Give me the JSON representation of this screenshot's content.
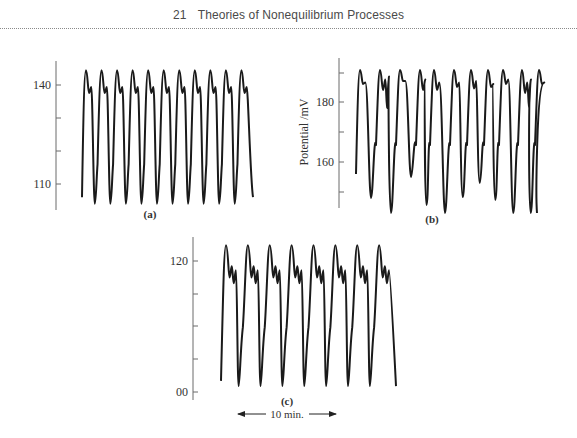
{
  "page": {
    "running_head_number": "21",
    "running_head_title": "Theories of Nonequilibrium Processes"
  },
  "colors": {
    "trace": "#1a1a1a",
    "axis": "#6a6a6a",
    "text": "#333333",
    "rule": "#8a8a8a"
  },
  "chart_data": [
    {
      "type": "line",
      "panel_label": "(a)",
      "title": "",
      "xlabel": "",
      "ylabel": "",
      "y_tick_labels": [
        "140",
        "110"
      ],
      "y_ticks": [
        140,
        130,
        120,
        110
      ],
      "ylim": [
        102,
        148
      ],
      "grid": false,
      "legend": null,
      "description": "Regular periodic oscillations, 11 cycles, each with a peak followed by a small shoulder",
      "cycles": 11,
      "series": [
        {
          "name": "potential",
          "cycle_shape": {
            "peak": 144.5,
            "shoulder_dip": 137.6,
            "shoulder_peak": 139.4,
            "trough": 104
          },
          "troughs": [
            104,
            104,
            104,
            104,
            104,
            104,
            104,
            104,
            104,
            104
          ],
          "start_value": 106,
          "end_value": 106
        }
      ]
    },
    {
      "type": "line",
      "panel_label": "(b)",
      "title": "",
      "xlabel": "",
      "ylabel": "Potential /mV",
      "y_tick_labels": [
        "180",
        "160"
      ],
      "y_ticks": [
        190,
        180,
        170,
        160,
        150
      ],
      "ylim": [
        140,
        195
      ],
      "grid": false,
      "legend": null,
      "description": "Irregular (chaotic-like) oscillations with varying trough depths and multi-peaked shoulders",
      "cycles": 11,
      "series": [
        {
          "name": "potential",
          "peaks": [
            190.7,
            190.7,
            190.7,
            190.7,
            190.7,
            190.7,
            190.7,
            190.7,
            190.7,
            190.7,
            190.7
          ],
          "troughs": [
            148,
            143,
            155,
            145.7,
            143,
            148.3,
            153,
            147.3,
            143,
            143
          ],
          "start_value": 156,
          "end_value": 143
        }
      ]
    },
    {
      "type": "line",
      "panel_label": "(c)",
      "title": "",
      "xlabel": "",
      "ylabel": "",
      "y_tick_labels": [
        "120",
        "00"
      ],
      "y_ticks": [
        120,
        115,
        110,
        105,
        100
      ],
      "ylim": [
        98,
        124
      ],
      "grid": false,
      "legend": null,
      "time_scale_annotation": "10 min.",
      "description": "Periodic oscillations, 8 cycles, each with a main peak followed by two smaller sub-peaks",
      "cycles": 8,
      "series": [
        {
          "name": "potential",
          "cycle_shape": {
            "peak": 122.4,
            "dip1": 117.5,
            "sub_peak1": 119.2,
            "dip2": 116.6,
            "sub_peak2": 118.6,
            "trough": 100.9
          },
          "start_value": 101.7,
          "end_value": 100.9
        }
      ]
    }
  ]
}
